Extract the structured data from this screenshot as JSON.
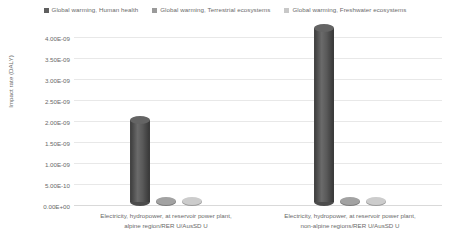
{
  "chart_data": {
    "type": "bar",
    "title": "",
    "subtitle": "",
    "xlabel": "",
    "ylabel": "Impact rate (DALY)",
    "categories": [
      "Electricity, hydropower, at reservoir power plant, alpine region/RER U/AusSD U",
      "Electricity, hydropower, at reservoir power plant, non-alpine regions/RER U/AusSD U"
    ],
    "category_lines": [
      [
        "Electricity, hydropower, at reservoir power plant,",
        "alpine region/RER U/AusSD U"
      ],
      [
        "Electricity, hydropower, at reservoir power plant,",
        "non-alpine regions/RER U/AusSD U"
      ]
    ],
    "series": [
      {
        "name": "Global warming, Human health",
        "color": "#5f5f5f",
        "values": [
          1.95e-09,
          4.15e-09
        ]
      },
      {
        "name": "Global warming, Terrestrial ecosystems",
        "color": "#9a9a9a",
        "values": [
          1.2e-11,
          2.6e-11
        ]
      },
      {
        "name": "Global warming, Freshwater ecosystems",
        "color": "#c2c2c2",
        "values": [
          3e-12,
          7e-12
        ]
      }
    ],
    "ylim": [
      0,
      4e-09
    ],
    "ytick_values": [
      0,
      5e-10,
      1e-09,
      1.5e-09,
      2e-09,
      2.5e-09,
      3e-09,
      3.5e-09,
      4e-09
    ],
    "ytick_labels": [
      "0.00E+00",
      "5.00E-10",
      "1.00E-09",
      "1.50E-09",
      "2.00E-09",
      "2.50E-09",
      "3.00E-09",
      "3.50E-09",
      "4.00E-09"
    ],
    "grid": true,
    "legend_position": "top",
    "style": "3d-cylinder"
  },
  "legend": {
    "entries": [
      {
        "label": "Global warming, Human health",
        "color": "#5f5f5f"
      },
      {
        "label": "Global warming, Terrestrial ecosystems",
        "color": "#9a9a9a"
      },
      {
        "label": "Global warming, Freshwater ecosystems",
        "color": "#c8c8c8"
      }
    ]
  },
  "axes": {
    "y_title": "Impact rate (DALY)"
  }
}
